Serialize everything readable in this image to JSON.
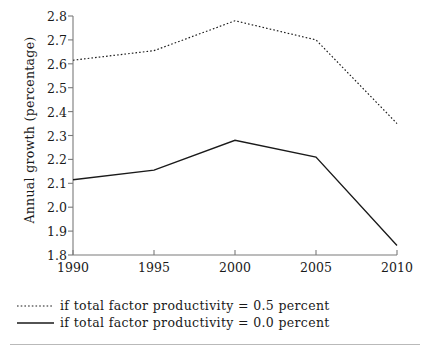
{
  "chart_data": {
    "type": "line",
    "title": "",
    "xlabel": "",
    "ylabel": "Annual growth (percentage)",
    "x": [
      1990,
      1995,
      2000,
      2005,
      2010
    ],
    "xtick_labels": [
      "1990",
      "1995",
      "2000",
      "2005",
      "2010"
    ],
    "ytick_labels": [
      "1.8",
      "1.9",
      "2.0",
      "2.1",
      "2.2",
      "2.3",
      "2.4",
      "2.5",
      "2.6",
      "2.7",
      "2.8"
    ],
    "ytick_values": [
      1.8,
      1.9,
      2.0,
      2.1,
      2.2,
      2.3,
      2.4,
      2.5,
      2.6,
      2.7,
      2.8
    ],
    "xlim": [
      1990,
      2010
    ],
    "ylim": [
      1.8,
      2.8
    ],
    "grid": false,
    "legend_position": "below-axes",
    "series": [
      {
        "name": "if total factor productivity = 0.5 percent",
        "style": "dotted",
        "color": "#1a1a1a",
        "values": [
          2.615,
          2.655,
          2.78,
          2.7,
          2.35
        ]
      },
      {
        "name": "if total factor productivity = 0.0 percent",
        "style": "solid",
        "color": "#1a1a1a",
        "values": [
          2.115,
          2.155,
          2.28,
          2.21,
          1.84
        ]
      }
    ]
  },
  "legend": {
    "items": [
      {
        "label": "if total factor productivity = 0.5 percent",
        "key": "dotted-line-key"
      },
      {
        "label": "if total factor productivity = 0.0 percent",
        "key": "solid-line-key"
      }
    ]
  },
  "axes": {
    "y_title": "Annual growth (percentage)"
  }
}
